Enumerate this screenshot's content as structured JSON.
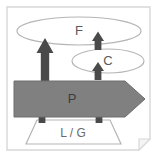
{
  "diagram": {
    "frame": {
      "border_color": "#d8d8d8",
      "background_color": "#ffffff",
      "page_curl": true
    },
    "layers": [
      {
        "id": "f-ellipse",
        "label": "F",
        "shape": "ellipse",
        "fill": "#ffffff",
        "stroke": "#b5b5b5"
      },
      {
        "id": "c-ellipse",
        "label": "C",
        "shape": "ellipse",
        "fill": "#ffffff",
        "stroke": "#b5b5b5"
      },
      {
        "id": "p-band",
        "label": "P",
        "shape": "right-arrow-band",
        "fill": "#808080",
        "stroke": "#6e6e6e"
      },
      {
        "id": "lg-trapezoid",
        "label": "L / G",
        "shape": "trapezoid",
        "fill": "#ffffff",
        "stroke": "#b5b5b5"
      }
    ],
    "connectors": [
      {
        "id": "arrow-p-to-f-large",
        "direction": "up",
        "size": "large",
        "color": "#4a4a4a"
      },
      {
        "id": "arrow-c-to-f",
        "direction": "up",
        "size": "small",
        "color": "#4a4a4a"
      },
      {
        "id": "arrow-p-to-c",
        "direction": "up",
        "size": "small",
        "color": "#4a4a4a"
      },
      {
        "id": "arrow-lg-to-p-left",
        "direction": "up",
        "size": "small",
        "color": "#4a4a4a"
      },
      {
        "id": "arrow-lg-to-p-right",
        "direction": "up",
        "size": "small",
        "color": "#4a4a4a"
      }
    ],
    "colors": {
      "band_fill": "#808080",
      "band_stroke": "#6e6e6e",
      "arrow_fill": "#4a4a4a",
      "outline": "#b5b5b5",
      "frame": "#d8d8d8",
      "text": "#5a5a5a",
      "background": "#ffffff"
    }
  }
}
